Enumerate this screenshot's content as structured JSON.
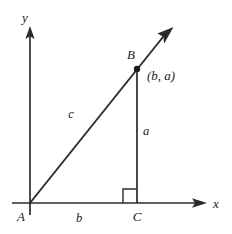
{
  "figure": {
    "background_color": "#ffffff",
    "stroke_color": "#2b2b2b",
    "text_color": "#1a1a1a"
  },
  "axes": {
    "x_label": "x",
    "y_label": "y",
    "origin_label": "A"
  },
  "vertices": {
    "a_label": "A",
    "b_label": "B",
    "c_label": "C"
  },
  "sides": {
    "hypotenuse_label": "c",
    "vertical_leg_label": "a",
    "horizontal_leg_label": "b"
  },
  "annotations": {
    "point_coordinates": "(b, a)",
    "right_angle_marker": "right-angle-square"
  },
  "geometry": {
    "origin": {
      "x": 30,
      "y": 203
    },
    "point_b": {
      "x": 137,
      "y": 69
    },
    "point_c": {
      "x": 137,
      "y": 203
    },
    "x_axis_end": {
      "x": 206,
      "y": 203
    },
    "y_axis_top": {
      "x": 30,
      "y": 27
    },
    "ray_tip": {
      "x": 173,
      "y": 28
    }
  }
}
